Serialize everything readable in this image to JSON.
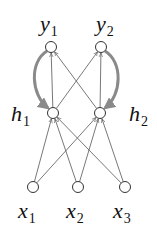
{
  "diagram": {
    "type": "neural-network",
    "nodes": [
      {
        "id": "y1",
        "label": "y",
        "sub": "1",
        "cx": 51,
        "cy": 47,
        "lx": 40,
        "ly": 31
      },
      {
        "id": "y2",
        "label": "y",
        "sub": "2",
        "cx": 101,
        "cy": 47,
        "lx": 96,
        "ly": 31
      },
      {
        "id": "h1",
        "label": "h",
        "sub": "1",
        "cx": 53,
        "cy": 113,
        "lx": 11,
        "ly": 121
      },
      {
        "id": "h2",
        "label": "h",
        "sub": "2",
        "cx": 100,
        "cy": 113,
        "lx": 129,
        "ly": 121
      },
      {
        "id": "x1",
        "label": "x",
        "sub": "1",
        "cx": 33,
        "cy": 187,
        "lx": 18,
        "ly": 218
      },
      {
        "id": "x2",
        "label": "x",
        "sub": "2",
        "cx": 78,
        "cy": 187,
        "lx": 66,
        "ly": 218
      },
      {
        "id": "x3",
        "label": "x",
        "sub": "3",
        "cx": 125,
        "cy": 187,
        "lx": 113,
        "ly": 218
      }
    ],
    "edges": [
      {
        "from": "h1",
        "to": "y1"
      },
      {
        "from": "h1",
        "to": "y2"
      },
      {
        "from": "h2",
        "to": "y1"
      },
      {
        "from": "h2",
        "to": "y2"
      },
      {
        "from": "x1",
        "to": "h1"
      },
      {
        "from": "x1",
        "to": "h2"
      },
      {
        "from": "x2",
        "to": "h1"
      },
      {
        "from": "x2",
        "to": "h2"
      },
      {
        "from": "x3",
        "to": "h1"
      },
      {
        "from": "x3",
        "to": "h2"
      }
    ],
    "feedback_edges": [
      {
        "from": "y1",
        "to": "h1",
        "side": "left"
      },
      {
        "from": "y2",
        "to": "h2",
        "side": "right"
      }
    ],
    "colors": {
      "node_stroke": "#333333",
      "edge": "#555555",
      "feedback": "#8a8a8a",
      "text": "#111111"
    }
  }
}
